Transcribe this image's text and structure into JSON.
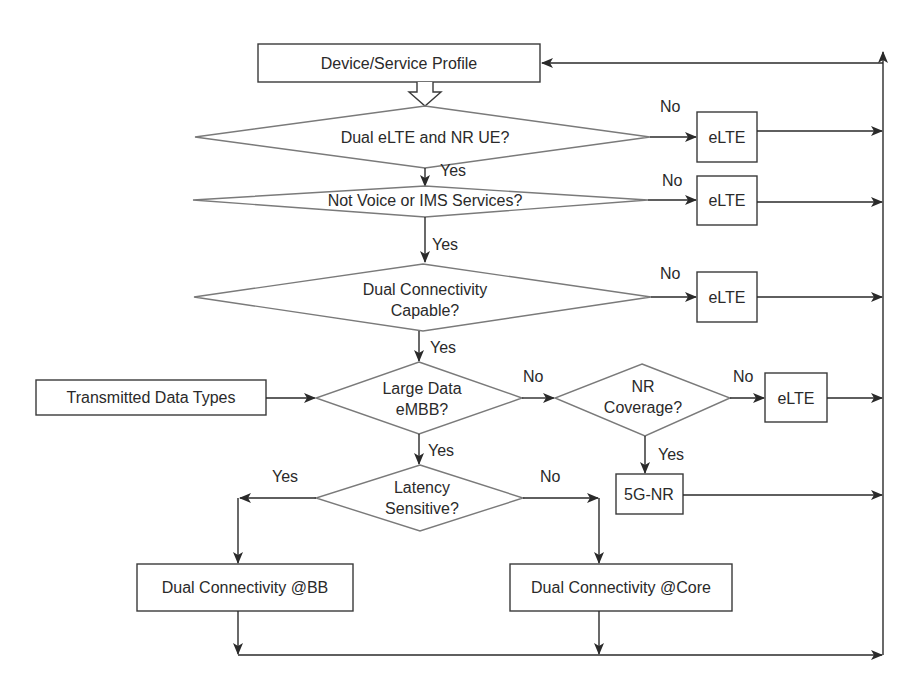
{
  "diagram": {
    "type": "flowchart",
    "nodes": {
      "start": {
        "label": "Device/Service Profile",
        "shape": "process"
      },
      "q_dual_ue": {
        "label": "Dual eLTE and NR UE?",
        "shape": "decision"
      },
      "q_not_voice": {
        "label": "Not Voice or IMS Services?",
        "shape": "decision"
      },
      "q_dc_capable": {
        "label_line1": "Dual Connectivity",
        "label_line2": "Capable?",
        "shape": "decision"
      },
      "data_types": {
        "label": "Transmitted Data Types",
        "shape": "process"
      },
      "q_large_data": {
        "label_line1": "Large Data",
        "label_line2": "eMBB?",
        "shape": "decision"
      },
      "q_nr_coverage": {
        "label_line1": "NR",
        "label_line2": "Coverage?",
        "shape": "decision"
      },
      "q_latency": {
        "label_line1": "Latency",
        "label_line2": "Sensitive?",
        "shape": "decision"
      },
      "elte_1": {
        "label": "eLTE",
        "shape": "process"
      },
      "elte_2": {
        "label": "eLTE",
        "shape": "process"
      },
      "elte_3": {
        "label": "eLTE",
        "shape": "process"
      },
      "elte_4": {
        "label": "eLTE",
        "shape": "process"
      },
      "nr_5g": {
        "label": "5G-NR",
        "shape": "process"
      },
      "dc_bb": {
        "label": "Dual Connectivity @BB",
        "shape": "process"
      },
      "dc_core": {
        "label": "Dual Connectivity @Core",
        "shape": "process"
      }
    },
    "edges": {
      "dual_ue_no": "No",
      "dual_ue_yes": "Yes",
      "not_voice_no": "No",
      "not_voice_yes": "Yes",
      "dc_capable_no": "No",
      "dc_capable_yes": "Yes",
      "large_data_no": "No",
      "large_data_yes": "Yes",
      "nr_coverage_no": "No",
      "nr_coverage_yes": "Yes",
      "latency_yes": "Yes",
      "latency_no": "No"
    },
    "colors": {
      "stroke": "#2a2a2a",
      "decision_stroke": "#7a7a7a",
      "background": "#ffffff"
    }
  }
}
